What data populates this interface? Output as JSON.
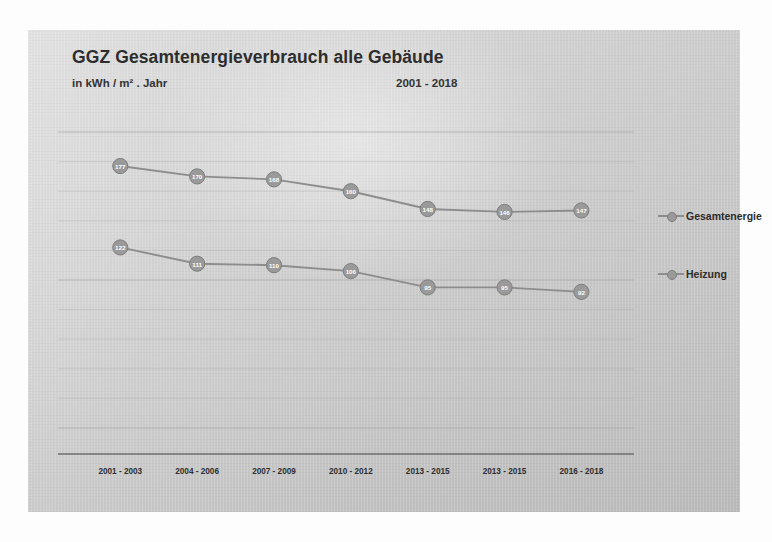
{
  "title": "GGZ  Gesamtenergieverbrauch alle Gebäude",
  "subtitle": "in kWh / m² . Jahr",
  "period": "2001 - 2018",
  "legend": {
    "items": [
      {
        "label": "Gesamtenergie",
        "marker": "circle-marker-icon"
      },
      {
        "label": "Heizung",
        "marker": "circle-marker-icon"
      }
    ]
  },
  "colors": {
    "panel": "#cccccc",
    "line": "#8d8d8d",
    "marker_fill": "#9a9a9a",
    "marker_stroke": "#7e7e7e",
    "marker_label": "#ffffff",
    "gridline": "#aaaaaa",
    "axis": "#6e6e6e",
    "text": "#2d2d2d"
  },
  "chart_data": {
    "type": "line",
    "title": "GGZ  Gesamtenergieverbrauch alle Gebäude",
    "subtitle": "in kWh / m² . Jahr",
    "xlabel": "",
    "ylabel": "kWh / m² . Jahr",
    "ylim": [
      0,
      200
    ],
    "grid": true,
    "gridline_count": 10,
    "y_tick_labels_shown": false,
    "legend_position": "right",
    "categories": [
      "2001 - 2003",
      "2004 - 2006",
      "2007 - 2009",
      "2010 - 2012",
      "2013 - 2015",
      "2013 - 2015",
      "2016 - 2018"
    ],
    "series": [
      {
        "name": "Gesamtenergie",
        "values": [
          177,
          170,
          168,
          160,
          148,
          146,
          147
        ],
        "point_labels": [
          "177",
          "170",
          "168",
          "160",
          "148",
          "146",
          "147"
        ]
      },
      {
        "name": "Heizung",
        "values": [
          122,
          111,
          110,
          106,
          95,
          95,
          92
        ],
        "point_labels": [
          "122",
          "111",
          "110",
          "106",
          "95",
          "95",
          "92"
        ]
      }
    ]
  }
}
